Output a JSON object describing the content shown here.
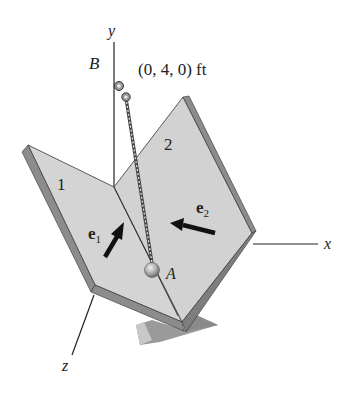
{
  "figure": {
    "axes": {
      "x_label": "x",
      "y_label": "y",
      "z_label": "z"
    },
    "points": {
      "B_label": "B",
      "B_coords": "(0, 4, 0) ft",
      "A_label": "A"
    },
    "plates": {
      "plate1_label": "1",
      "plate2_label": "2"
    },
    "vectors": {
      "e1_base": "e",
      "e1_sub": "1",
      "e2_base": "e",
      "e2_sub": "2"
    },
    "colors": {
      "plate_face": "#d4d4d4",
      "plate_edge": "#8c8c8c",
      "plate_edge_dark": "#6e6e6e",
      "stand": "#9a9a9a",
      "stand_light": "#c8c8c8",
      "line": "#222222",
      "ball": "#b8b8b8"
    }
  }
}
